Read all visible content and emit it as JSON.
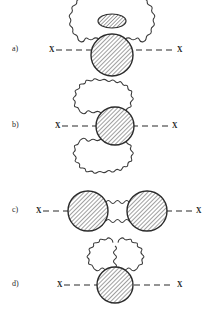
{
  "figure": {
    "caption_present": false,
    "background_color": "#ffffff",
    "ink_color": "#2b2b2b",
    "hatch_color": "#4a4a4a",
    "width": 211,
    "height": 309
  },
  "panels": [
    {
      "id": "a",
      "label": "a)",
      "label_x": 12,
      "label_y": 45,
      "axis_y": 50,
      "left_vertex_label": "X",
      "left_vertex_x": 49,
      "right_vertex_label": "X",
      "right_vertex_x": 177,
      "dash_start": 56,
      "dash_end": 174,
      "main_blob": {
        "cx": 112,
        "cy": 55,
        "rx": 21,
        "ry": 21
      },
      "secondary_blob": {
        "cx": 112,
        "cy": 21,
        "rx": 14,
        "ry": 7
      },
      "photon_loops": 1,
      "description": "self-energy blob with wavy photon loop ending in small hatched ellipse above"
    },
    {
      "id": "b",
      "label": "b)",
      "label_x": 12,
      "label_y": 127,
      "axis_y": 126,
      "left_vertex_label": "X",
      "left_vertex_x": 55,
      "right_vertex_label": "X",
      "right_vertex_x": 172,
      "dash_start": 62,
      "dash_end": 169,
      "main_blob": {
        "cx": 115,
        "cy": 126,
        "rx": 19,
        "ry": 19
      },
      "photon_loops": 2,
      "description": "central hatched blob with wavy photon loop above and below"
    },
    {
      "id": "c",
      "label": "c)",
      "label_x": 12,
      "label_y": 208,
      "axis_y": 211,
      "left_vertex_label": "X",
      "left_vertex_x": 36,
      "right_vertex_label": "X",
      "right_vertex_x": 196,
      "dash_start": 43,
      "dash_end": 193,
      "left_blob": {
        "cx": 88,
        "cy": 211,
        "rx": 20,
        "ry": 20
      },
      "right_blob": {
        "cx": 147,
        "cy": 211,
        "rx": 20,
        "ry": 20
      },
      "photon_loops": 2,
      "description": "two hatched blobs joined by a pair of wavy photon lines"
    },
    {
      "id": "d",
      "label": "d)",
      "label_x": 12,
      "label_y": 285,
      "axis_y": 285,
      "left_vertex_label": "X",
      "left_vertex_x": 57,
      "right_vertex_label": "X",
      "right_vertex_x": 177,
      "dash_start": 64,
      "dash_end": 174,
      "main_blob": {
        "cx": 115,
        "cy": 285,
        "rx": 18,
        "ry": 18
      },
      "photon_loops": 2,
      "description": "hatched blob with two wavy photon loops forming a double arch above"
    }
  ],
  "artifacts": {
    "bleed_through_top": "",
    "note": "faint scanner bleed-through at top of page"
  }
}
